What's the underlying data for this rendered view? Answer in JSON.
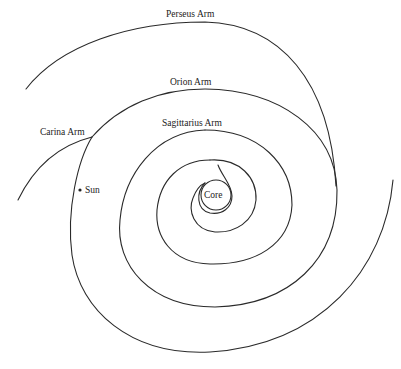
{
  "diagram": {
    "labels": {
      "perseus": "Perseus Arm",
      "orion": "Orion Arm",
      "sagittarius": "Sagittarius Arm",
      "carina": "Carina Arm",
      "sun": "Sun",
      "core": "Core"
    },
    "colors": {
      "line": "#2a2a2a",
      "background": "#ffffff"
    }
  }
}
